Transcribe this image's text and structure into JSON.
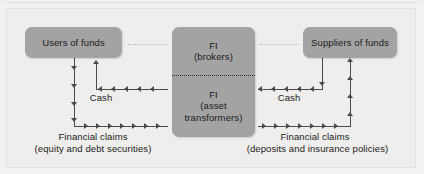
{
  "diagram": {
    "title_visible": false,
    "colors": {
      "page_background": "#efeeec",
      "box_fill": "#a3a3a3",
      "line": "#4a4a4a",
      "connector_dotted": "#b8b7b4",
      "text": "#1b1b1b"
    },
    "entities": {
      "users": {
        "label": "Users of funds"
      },
      "suppliers": {
        "label": "Suppliers of funds"
      },
      "fi_brokers": {
        "line1": "FI",
        "line2": "(brokers)"
      },
      "fi_asset_transformers": {
        "line1": "FI",
        "line2": "(asset",
        "line3": "transformers)"
      }
    },
    "flows": {
      "left_cash_label": "Cash",
      "right_cash_label": "Cash",
      "left_claims_line1": "Financial claims",
      "left_claims_line2": "(equity and debt securities)",
      "right_claims_line1": "Financial claims",
      "right_claims_line2": "(deposits and insurance policies)"
    }
  }
}
